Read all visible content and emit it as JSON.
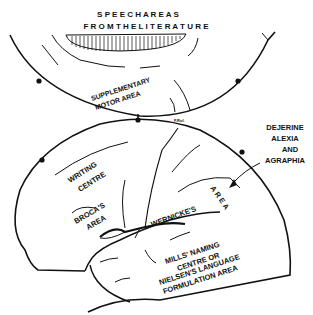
{
  "title": {
    "line1": "S P E E C H   A R E A S",
    "line2": "F R O M   T H E   L I T E R A T U R E"
  },
  "labels": {
    "supplementary_1": "SUPPLEMENTARY",
    "supplementary_2": "MOTOR  AREA",
    "dejerine_1": "DEJERINE",
    "dejerine_2": "ALEXIA",
    "dejerine_3": "AND",
    "dejerine_4": "AGRAPHIA",
    "writing_1": "WRITING",
    "writing_2": "CENTRE",
    "broca_1": "BROCA'S",
    "broca_2": "AREA",
    "wernicke": "WERNICKE'S",
    "wernicke_area": "A R E A",
    "mills_1": "MILLS'  NAMING",
    "mills_2": "CENTRE    OR",
    "mills_3": "NIELSEN'S LANGUAGE",
    "mills_4": "FORMULATION   AREA",
    "fissure_tag": "F.Rol."
  },
  "colors": {
    "ink": "#111111",
    "background": "#ffffff"
  }
}
